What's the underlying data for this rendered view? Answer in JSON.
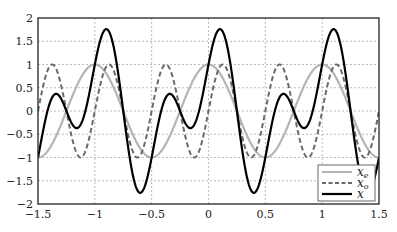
{
  "chart_data": {
    "type": "line",
    "title": "",
    "xlabel": "",
    "ylabel": "",
    "xlim": [
      -1.5,
      1.5
    ],
    "ylim": [
      -2,
      2
    ],
    "grid": true,
    "legend_position": "lower right",
    "xticks": [
      -1.5,
      -1,
      -0.5,
      0,
      0.5,
      1,
      1.5
    ],
    "xtick_labels": [
      "−1.5",
      "−1",
      "−0.5",
      "0",
      "0.5",
      "1",
      "1.5"
    ],
    "yticks": [
      -2,
      -1.5,
      -1,
      -0.5,
      0,
      0.5,
      1,
      1.5,
      2
    ],
    "ytick_labels": [
      "−2",
      "−1.5",
      "−1",
      "−0.5",
      "0",
      "0.5",
      "1",
      "1.5",
      "2"
    ],
    "series": [
      {
        "name": "x_e",
        "label": "x",
        "subscript": "e",
        "formula": "cos(2*pi*t)",
        "style": "solid",
        "color": "#b5b5b5",
        "width": 2.2,
        "x": [
          -1.5,
          -1.25,
          -1,
          -0.75,
          -0.5,
          -0.25,
          0,
          0.25,
          0.5,
          0.75,
          1,
          1.25,
          1.5
        ],
        "values": [
          -1,
          0,
          1,
          0,
          -1,
          0,
          1,
          0,
          -1,
          0,
          1,
          0,
          -1
        ]
      },
      {
        "name": "x_o",
        "label": "x",
        "subscript": "o",
        "formula": "sin(4*pi*t)",
        "style": "dashed",
        "color": "#6a6a6a",
        "width": 2,
        "x": [
          -1.5,
          -1.375,
          -1.25,
          -1.125,
          -1,
          -0.875,
          -0.75,
          -0.625,
          -0.5,
          -0.375,
          -0.25,
          -0.125,
          0,
          0.125,
          0.25,
          0.375,
          0.5,
          0.625,
          0.75,
          0.875,
          1,
          1.125,
          1.25,
          1.375,
          1.5
        ],
        "values": [
          0,
          1,
          0,
          -1,
          0,
          1,
          0,
          -1,
          0,
          1,
          0,
          -1,
          0,
          1,
          0,
          -1,
          0,
          1,
          0,
          -1,
          0,
          1,
          0,
          -1,
          0
        ]
      },
      {
        "name": "x",
        "label": "x",
        "subscript": "",
        "formula": "cos(2*pi*t)+sin(4*pi*t)",
        "style": "solid",
        "color": "#000000",
        "width": 2.2,
        "x": [
          -1.5,
          -1.375,
          -1.25,
          -1.125,
          -1,
          -0.875,
          -0.75,
          -0.625,
          -0.5,
          -0.375,
          -0.25,
          -0.125,
          0,
          0.125,
          0.25,
          0.375,
          0.5,
          0.625,
          0.75,
          0.875,
          1,
          1.125,
          1.25,
          1.375,
          1.5
        ],
        "values": [
          -1,
          0.29,
          0,
          -0.29,
          1,
          1.71,
          0,
          -1.71,
          -1,
          0.29,
          0,
          -0.29,
          1,
          1.71,
          0,
          -1.71,
          -1,
          0.29,
          0,
          -0.29,
          1,
          1.71,
          0,
          -1.71,
          -1
        ]
      }
    ]
  },
  "legend": {
    "items": [
      {
        "label": "x",
        "sub": "e"
      },
      {
        "label": "x",
        "sub": "o"
      },
      {
        "label": "x",
        "sub": ""
      }
    ]
  }
}
